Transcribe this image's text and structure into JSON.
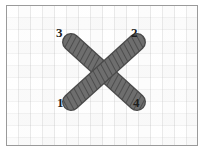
{
  "figure": {
    "type": "cross-stitch-diagram",
    "background": "basketweave fabric",
    "frame_color": "#9a9a9a",
    "fabric_color": "#f7f7f7"
  },
  "stitch": {
    "thread_color": "#6e6e6e",
    "thread_outline_color": "#4a4a4a",
    "twist_line_color": "#3f3f3f",
    "strand_width_px": 16,
    "strands": [
      {
        "name": "first-stitch-strand",
        "from_label": "1",
        "to_label": "2",
        "start": {
          "x": 70,
          "y": 102
        },
        "end": {
          "x": 136,
          "y": 42
        }
      },
      {
        "name": "second-stitch-strand",
        "from_label": "3",
        "to_label": "4",
        "start": {
          "x": 70,
          "y": 42
        },
        "end": {
          "x": 136,
          "y": 102
        }
      }
    ]
  },
  "labels": [
    {
      "id": "label-3",
      "text": "3",
      "position": "top-left",
      "x": 56,
      "y": 26
    },
    {
      "id": "label-2",
      "text": "2",
      "position": "top-right",
      "x": 131,
      "y": 26
    },
    {
      "id": "label-1",
      "text": "1",
      "position": "bottom-left",
      "x": 57,
      "y": 96
    },
    {
      "id": "label-4",
      "text": "4",
      "position": "bottom-right",
      "x": 133,
      "y": 96
    }
  ]
}
